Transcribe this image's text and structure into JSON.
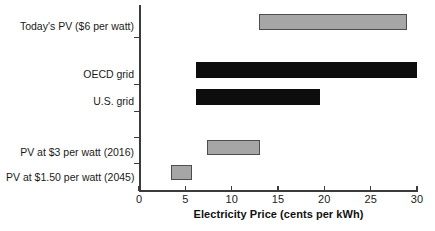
{
  "chart_data": {
    "type": "bar",
    "orientation": "horizontal",
    "subtype": "range-bar",
    "title": "",
    "xlabel": "Electricity Price (cents per kWh)",
    "ylabel": "",
    "xlim": [
      0,
      30
    ],
    "xticks": [
      0,
      5,
      10,
      15,
      20,
      25,
      30
    ],
    "xtick_labels": [
      "0",
      "5",
      "10",
      "15",
      "20",
      "25",
      "30"
    ],
    "grid": false,
    "legend": "none",
    "categories": [
      "Today's PV ($6 per watt)",
      "OECD grid",
      "U.S. grid",
      "PV at $3 per watt (2016)",
      "PV at $1.50 per watt (2045)"
    ],
    "bars": [
      {
        "label": "Today's PV ($6 per watt)",
        "start": 13.0,
        "end": 28.9,
        "color": "#a6a6a6",
        "edge_color": "#4d4d4d"
      },
      {
        "label": "OECD grid",
        "start": 6.2,
        "end": 30.0,
        "color": "#0d0d0d",
        "edge_color": "#0d0d0d"
      },
      {
        "label": "U.S. grid",
        "start": 6.2,
        "end": 19.5,
        "color": "#0d0d0d",
        "edge_color": "#0d0d0d"
      },
      {
        "label": "PV at $3 per watt (2016)",
        "start": 7.3,
        "end": 13.1,
        "color": "#a6a6a6",
        "edge_color": "#4d4d4d"
      },
      {
        "label": "PV at $1.50 per watt (2045)",
        "start": 3.4,
        "end": 5.7,
        "color": "#a6a6a6",
        "edge_color": "#4d4d4d"
      }
    ]
  },
  "axis": {
    "x_title": "Electricity Price (cents per kWh)",
    "tick_labels": [
      "0",
      "5",
      "10",
      "15",
      "20",
      "25",
      "30"
    ]
  },
  "labels": {
    "row0": "Today's PV ($6 per watt)",
    "row1": "OECD grid",
    "row2": "U.S. grid",
    "row3": "PV at $3 per watt (2016)",
    "row4": "PV at $1.50 per watt (2045)"
  },
  "colors": {
    "bar_grey_fill": "#a6a6a6",
    "bar_grey_edge": "#4d4d4d",
    "bar_black_fill": "#0d0d0d",
    "axis": "#3b3b3b",
    "text": "#1a1a1a",
    "background": "#ffffff"
  }
}
